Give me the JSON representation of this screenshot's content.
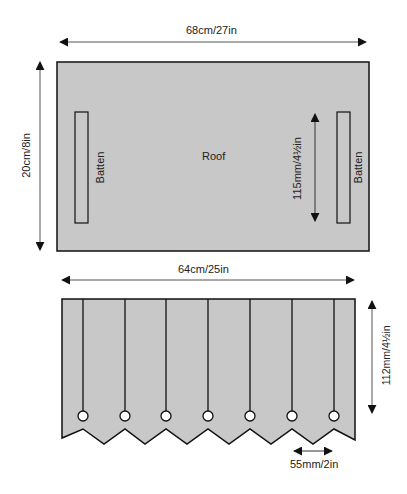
{
  "colors": {
    "fill": "#c8c8c8",
    "stroke": "#111111",
    "arrow": "#111111",
    "dim_line": "#555555",
    "hole_fill": "#ffffff"
  },
  "roof": {
    "label": "Roof",
    "width_label": "68cm/27in",
    "depth_label": "20cm/8in",
    "batten_left_label": "Batten",
    "batten_right_label": "Batten",
    "batten_length_label": "115mm/4½in"
  },
  "valance": {
    "width_label": "64cm/25in",
    "height_label": "112mm/4½in",
    "point_spacing_label": "55mm/2in",
    "fold_count": 7
  }
}
